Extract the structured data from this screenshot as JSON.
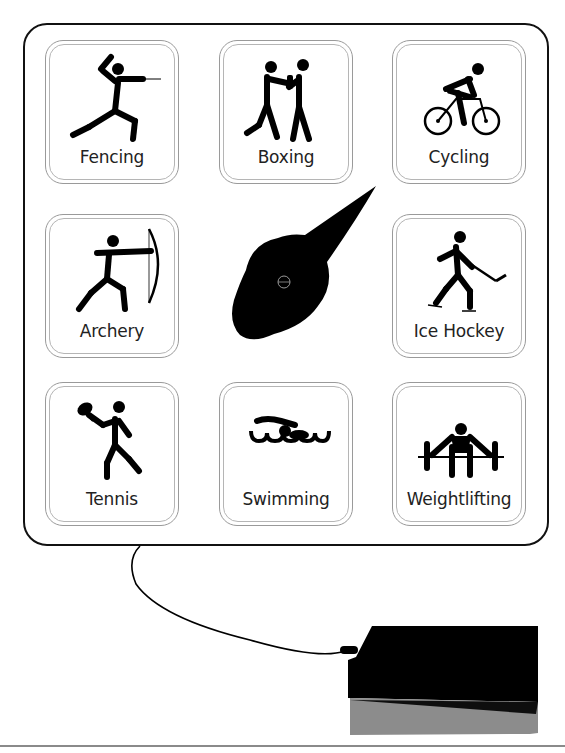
{
  "board": {
    "tiles": [
      {
        "id": "fencing",
        "label": "Fencing",
        "icon": "fencing-pictogram-icon"
      },
      {
        "id": "boxing",
        "label": "Boxing",
        "icon": "boxing-pictogram-icon"
      },
      {
        "id": "cycling",
        "label": "Cycling",
        "icon": "cycling-pictogram-icon"
      },
      {
        "id": "archery",
        "label": "Archery",
        "icon": "archery-pictogram-icon"
      },
      {
        "id": "ice-hockey",
        "label": "Ice Hockey",
        "icon": "ice-hockey-pictogram-icon"
      },
      {
        "id": "tennis",
        "label": "Tennis",
        "icon": "tennis-pictogram-icon"
      },
      {
        "id": "swimming",
        "label": "Swimming",
        "icon": "swimming-pictogram-icon"
      },
      {
        "id": "weightlifting",
        "label": "Weightlifting",
        "icon": "weightlifting-pictogram-icon"
      }
    ],
    "spinner": {
      "icon": "spinner-pointer-icon",
      "color": "#000000"
    }
  },
  "controller": {
    "icon": "controller-box-icon",
    "cable": "cable"
  },
  "colors": {
    "ink": "#000000",
    "tile_border": "#9a9a9a",
    "shadow": "#8c8c8c"
  }
}
